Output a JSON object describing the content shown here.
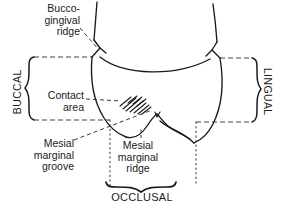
{
  "figure": {
    "ink_color": "#1a1a1a",
    "background": "#ffffff",
    "width": 281,
    "height": 210
  },
  "labels": {
    "bucco_gingival_ridge": "Bucco-\ngingival\nridge",
    "contact_area": "Contact\narea",
    "mesial_marginal_groove": "Mesial\nmarginal\ngroove",
    "mesial_marginal_ridge": "Mesial\nmarginal\nridge",
    "occlusal": "OCCLUSAL",
    "buccal": "BUCCAL",
    "lingual": "LINGUAL"
  },
  "annotations": {
    "leader_style": "dashed",
    "brace_style": "curly",
    "boundary_style": "dotted",
    "hatching": "contact-area-hatch"
  }
}
